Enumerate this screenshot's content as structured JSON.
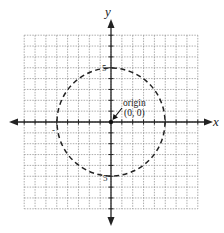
{
  "chart_data": {
    "type": "diagram",
    "title": "",
    "axes": {
      "x_label": "x",
      "y_label": "y",
      "grid": true,
      "xlim": [
        -8,
        8
      ],
      "ylim": [
        -8,
        8
      ]
    },
    "circle": {
      "center": [
        0,
        0
      ],
      "radius": 5,
      "style": "dashed"
    },
    "tick_labels": [
      {
        "axis": "y",
        "value": 5,
        "text": "5"
      },
      {
        "axis": "x",
        "value": -5,
        "text": "-5"
      },
      {
        "axis": "y",
        "value": -5,
        "text": "-5"
      },
      {
        "axis": "x",
        "value": 5,
        "text": "5"
      }
    ],
    "annotations": [
      {
        "text": "origin",
        "point": [
          0,
          0
        ]
      },
      {
        "text": "(0, 0)",
        "point": [
          0,
          0
        ]
      }
    ]
  },
  "labels": {
    "x_axis": "x",
    "y_axis": "y",
    "y_pos5": "5",
    "y_neg5": "5",
    "x_neg5": "-",
    "origin_word": "origin",
    "origin_coords": "(0, 0)"
  },
  "colors": {
    "grid": "#8a8a8a",
    "axis": "#222222",
    "circle": "#222222"
  }
}
